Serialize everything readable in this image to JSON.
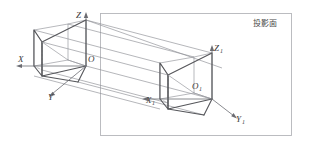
{
  "figure": {
    "plane_label": "投影面",
    "colors": {
      "background": "#ffffff",
      "solid_edge": "#55565a",
      "back_edge": "#9a9ba0",
      "hidden_edge": "#a6a7ac",
      "projection_ray": "#8d8e94",
      "axis": "#6b6c72",
      "plane_border": "#b4b5ba",
      "label_text": "#3a3a3a"
    },
    "object_axes": {
      "x_label": "X",
      "y_label": "Y",
      "z_label": "Z",
      "origin_label": "O"
    },
    "image_axes": {
      "x_label": "X",
      "x_sub": "1",
      "y_label": "Y",
      "y_sub": "1",
      "z_label": "Z",
      "z_sub": "1",
      "origin_label": "O",
      "origin_sub": "1"
    }
  }
}
